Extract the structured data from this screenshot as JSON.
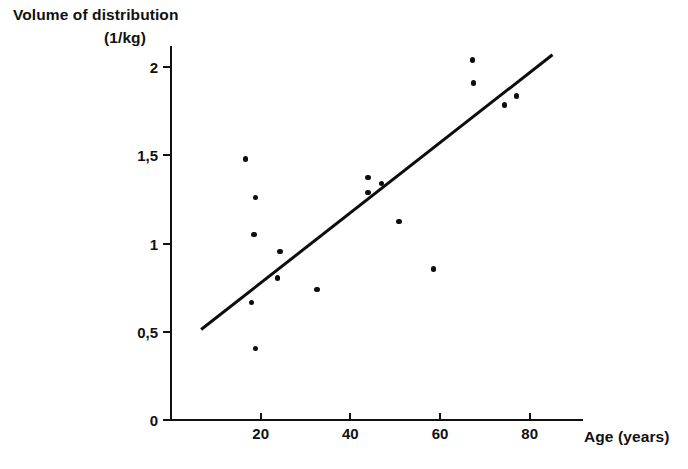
{
  "chart_data": {
    "type": "scatter",
    "title": "",
    "ylabel": "Volume of distribution",
    "ylabel_units": "(1/kg)",
    "xlabel": "Age (years)",
    "xlim": [
      0.4,
      92
    ],
    "ylim": [
      0,
      2.12
    ],
    "grid": false,
    "legend": null,
    "x_ticks": [
      {
        "value": 20,
        "label": "20"
      },
      {
        "value": 40,
        "label": "40"
      },
      {
        "value": 60,
        "label": "60"
      },
      {
        "value": 80,
        "label": "80"
      }
    ],
    "y_ticks": [
      {
        "value": 0,
        "label": "0"
      },
      {
        "value": 0.5,
        "label": "0,5"
      },
      {
        "value": 1,
        "label": "1"
      },
      {
        "value": 1.5,
        "label": "1,5"
      },
      {
        "value": 2,
        "label": "2"
      }
    ],
    "points": [
      {
        "x": 16.6,
        "y": 1.48
      },
      {
        "x": 18.8,
        "y": 1.26
      },
      {
        "x": 18.5,
        "y": 1.05
      },
      {
        "x": 17.9,
        "y": 0.665
      },
      {
        "x": 18.9,
        "y": 0.405
      },
      {
        "x": 24.3,
        "y": 0.955
      },
      {
        "x": 23.8,
        "y": 0.805
      },
      {
        "x": 32.6,
        "y": 0.74
      },
      {
        "x": 43.9,
        "y": 1.375
      },
      {
        "x": 47.0,
        "y": 1.34
      },
      {
        "x": 43.9,
        "y": 1.29
      },
      {
        "x": 50.9,
        "y": 1.125
      },
      {
        "x": 58.6,
        "y": 0.855
      },
      {
        "x": 67.3,
        "y": 2.04
      },
      {
        "x": 67.5,
        "y": 1.91
      },
      {
        "x": 74.4,
        "y": 1.785
      },
      {
        "x": 77.1,
        "y": 1.835
      }
    ],
    "trendline": {
      "x_start": 6.7,
      "y_start": 0.515,
      "x_end": 85.0,
      "y_end": 2.07,
      "slope": 0.0199,
      "intercept": 0.382
    }
  }
}
